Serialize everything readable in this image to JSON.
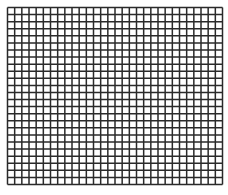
{
  "grid": {
    "columns": 30,
    "rows": 25,
    "left": 7,
    "top": 7,
    "width": 215,
    "height": 177,
    "line_color": "#2a2a2a",
    "cell_color": "#ffffff",
    "line_width": 1.5
  }
}
